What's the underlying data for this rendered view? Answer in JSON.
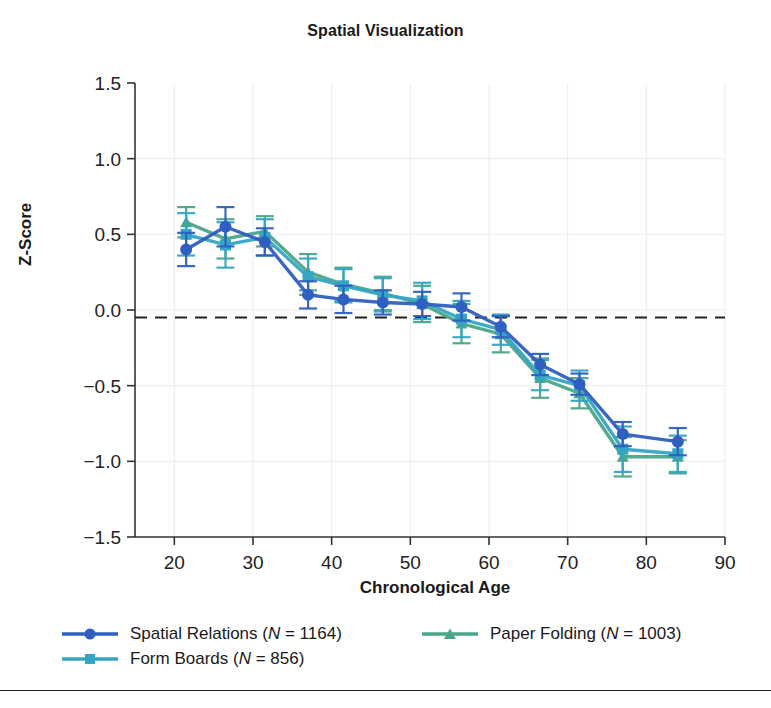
{
  "chart_data": {
    "type": "line",
    "title": "Spatial Visualization",
    "xlabel": "Chronological Age",
    "ylabel": "Z-Score",
    "xlim": [
      15,
      90
    ],
    "ylim": [
      -1.5,
      1.5
    ],
    "xticks": [
      20,
      30,
      40,
      50,
      60,
      70,
      80,
      90
    ],
    "yticks": [
      1.5,
      1.0,
      0.5,
      0.0,
      -0.5,
      -1.0,
      -1.5
    ],
    "ytick_labels": [
      "1.5",
      "1.0",
      "0.5",
      "0.0",
      "-0.5",
      "-1.0",
      "-1.5"
    ],
    "xtick_labels": [
      "20",
      "30",
      "40",
      "50",
      "60",
      "70",
      "80",
      "90"
    ],
    "grid": true,
    "legend_position": "below-axes",
    "reference_line": {
      "y": -0.05,
      "style": "dashed",
      "color": "#222222"
    },
    "error_bars": "95% CI whiskers shown on every point",
    "series": [
      {
        "name": "Spatial Relations",
        "n": 1164,
        "legend_label": "Spatial Relations (N = 1164)",
        "color": "#2f5fc0",
        "marker": "circle",
        "x": [
          21.5,
          26.5,
          31.5,
          37,
          41.5,
          46.5,
          51.5,
          56.5,
          61.5,
          66.5,
          71.5,
          77,
          84
        ],
        "y": [
          0.4,
          0.55,
          0.45,
          0.1,
          0.07,
          0.05,
          0.04,
          0.02,
          -0.11,
          -0.36,
          -0.49,
          -0.82,
          -0.87
        ],
        "yerr": [
          0.11,
          0.13,
          0.09,
          0.09,
          0.09,
          0.08,
          0.08,
          0.09,
          0.07,
          0.07,
          0.07,
          0.08,
          0.09
        ]
      },
      {
        "name": "Form Boards",
        "n": 856,
        "legend_label": "Form Boards (N = 856)",
        "color": "#35a5c4",
        "marker": "square",
        "x": [
          21.5,
          26.5,
          31.5,
          37,
          41.5,
          46.5,
          51.5,
          56.5,
          61.5,
          66.5,
          71.5,
          77,
          84
        ],
        "y": [
          0.5,
          0.43,
          0.48,
          0.22,
          0.16,
          0.1,
          0.06,
          -0.06,
          -0.13,
          -0.43,
          -0.5,
          -0.92,
          -0.95
        ],
        "yerr": [
          0.14,
          0.15,
          0.12,
          0.12,
          0.11,
          0.11,
          0.12,
          0.12,
          0.1,
          0.1,
          0.1,
          0.15,
          0.12
        ]
      },
      {
        "name": "Paper Folding",
        "n": 1003,
        "legend_label": "Paper Folding (N = 1003)",
        "color": "#4ba58a",
        "marker": "triangle",
        "x": [
          21.5,
          26.5,
          31.5,
          37,
          41.5,
          46.5,
          51.5,
          56.5,
          61.5,
          66.5,
          71.5,
          77,
          84
        ],
        "y": [
          0.58,
          0.47,
          0.52,
          0.25,
          0.17,
          0.11,
          0.04,
          -0.09,
          -0.16,
          -0.45,
          -0.55,
          -0.97,
          -0.97
        ],
        "yerr": [
          0.1,
          0.13,
          0.1,
          0.12,
          0.11,
          0.11,
          0.12,
          0.13,
          0.12,
          0.13,
          0.1,
          0.13,
          0.11
        ]
      }
    ]
  },
  "legend": {
    "entries": [
      {
        "label": "Spatial Relations (N = 1164)",
        "pre": "Spatial Relations (",
        "italic": "N",
        "post": " = 1164)",
        "color": "#2f5fc0",
        "marker": "circle"
      },
      {
        "label": "Paper Folding (N = 1003)",
        "pre": "Paper Folding (",
        "italic": "N",
        "post": " = 1003)",
        "color": "#4ba58a",
        "marker": "triangle"
      },
      {
        "label": "Form Boards (N = 856)",
        "pre": "Form Boards (",
        "italic": "N",
        "post": " = 856)",
        "color": "#35a5c4",
        "marker": "square"
      }
    ]
  }
}
